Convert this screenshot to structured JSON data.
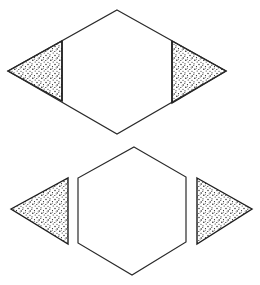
{
  "figure": {
    "colors": {
      "stroke": "#2a2a2a",
      "fill": "#ffffff",
      "stipple": "#1e1e1e"
    },
    "top_group": {
      "label": "assembled rhombus",
      "pieces": [
        "left-triangle-shaded",
        "central-hexagon",
        "right-triangle-shaded"
      ]
    },
    "bottom_group": {
      "label": "separated pieces",
      "pieces": [
        "left-triangle-shaded",
        "hexagon",
        "right-triangle-shaded"
      ]
    }
  }
}
